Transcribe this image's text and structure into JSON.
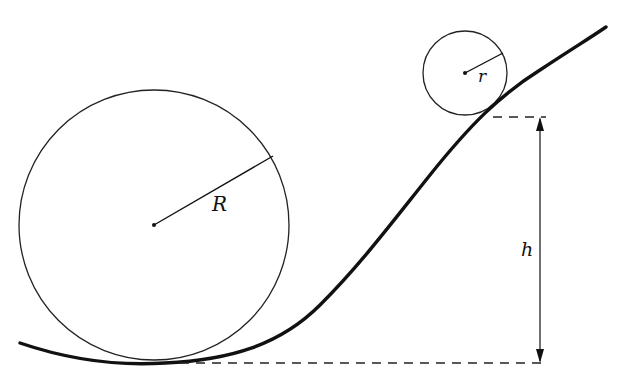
{
  "diagram": {
    "title": "",
    "colors": {
      "ink": "#111111",
      "background": "#ffffff"
    },
    "labels": {
      "big_radius": "R",
      "small_radius": "r",
      "height": "h"
    },
    "elements": [
      {
        "id": "large-circle",
        "type": "circle",
        "center": [
          154,
          225
        ],
        "radius": 135
      },
      {
        "id": "small-circle",
        "type": "circle",
        "center": [
          465,
          73
        ],
        "radius": 42
      },
      {
        "id": "track-curve",
        "type": "curve",
        "description": "S-shaped ramp; low at left, rises to upper right"
      },
      {
        "id": "height-dimension",
        "type": "dimension-arrow",
        "from_y": 117,
        "to_y": 363,
        "x": 540
      }
    ]
  }
}
